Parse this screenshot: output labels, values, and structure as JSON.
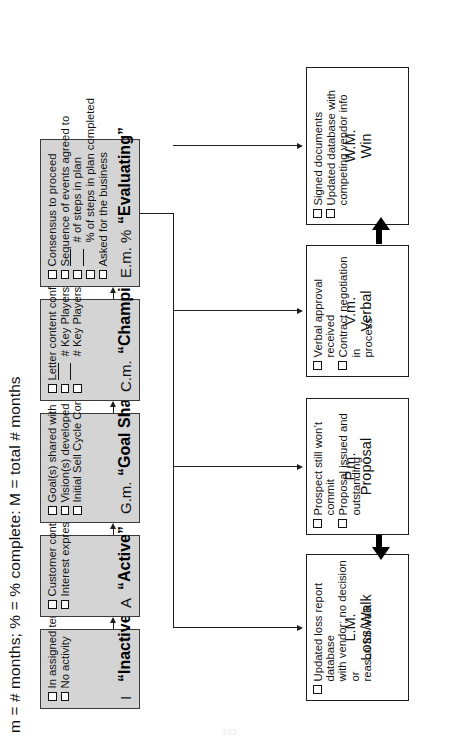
{
  "document": {
    "legend": "m = # months;  % = % complete:  M = total # months",
    "page_number": "183"
  },
  "stages": [
    {
      "code": "I",
      "name": "“Inactive”",
      "items": [
        {
          "line": false,
          "label": "In assigned territory"
        },
        {
          "line": false,
          "label": "No activity"
        }
      ]
    },
    {
      "code": "A",
      "name": "“Active”",
      "items": [
        {
          "line": false,
          "label": "Customer contact made"
        },
        {
          "line": false,
          "label": "Interest expressed"
        }
      ]
    },
    {
      "code": "G.m.",
      "name": "“Goal Shared”",
      "items": [
        {
          "line": false,
          "label": "Goal(s) shared with seller"
        },
        {
          "line": false,
          "label": "Vision(s) developed"
        },
        {
          "line": false,
          "label": "Initial Sell Cycle Control letter sent"
        }
      ]
    },
    {
      "code": "C.m.",
      "name": "“Champion”",
      "items": [
        {
          "line": false,
          "label": "Letter content confirmed"
        },
        {
          "line": true,
          "label": "# Key Players requested"
        },
        {
          "line": true,
          "label": "# Key Players interviewed"
        }
      ]
    },
    {
      "code": "E.m. %",
      "name": "“Evaluating”",
      "items": [
        {
          "line": false,
          "label": "Consensus to proceed"
        },
        {
          "line": false,
          "label": "Sequence of events agreed to"
        },
        {
          "line": true,
          "label": "# of steps in plan"
        },
        {
          "line": true,
          "label": "% of steps in plan completed"
        },
        {
          "line": false,
          "label": "Asked for the business"
        }
      ]
    }
  ],
  "outcomes": [
    {
      "code": "L.M.",
      "name": "Loss/Walk",
      "items": [
        "Updated loss report database\nwith vendor; no decision or\nreason for walk"
      ]
    },
    {
      "code": "P.m.",
      "name": "Proposal",
      "items": [
        "Prospect still won’t commit",
        "Proposal issued and\noutstanding"
      ]
    },
    {
      "code": "V.m.",
      "name": "Verbal",
      "items": [
        "Verbal approval received",
        "Contract negotiation in\nprocess"
      ]
    },
    {
      "code": "W.M.",
      "name": "Win",
      "items": [
        "Signed documents",
        "Updated database with\ncompeting vendor info"
      ]
    }
  ],
  "icons": {
    "checkbox": "empty-checkbox",
    "arrow": "arrow-right",
    "thick_arrow": "thick-arrow"
  },
  "colors": {
    "stage_fill": "#d4d4d4",
    "stage_border": "#3a3a3a",
    "outcome_fill": "#ffffff",
    "outcome_border": "#1d1d1d",
    "text": "#111111"
  }
}
